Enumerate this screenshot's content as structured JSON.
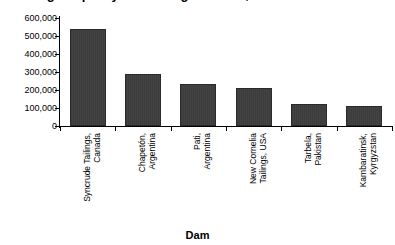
{
  "chart_data": {
    "type": "bar",
    "title": "Storage Capacity of the Largest Dams, in Millions of Gallons",
    "xlabel": "Dam",
    "ylabel": "",
    "categories": [
      "Syncrude Tailings, Canada",
      "Chapetón, Argentina",
      "Pati, Argentina",
      "New Cornelia Tailings, USA",
      "Tarbela, Pakistan",
      "Kambaratinsk, Kyrgyzstan"
    ],
    "category_lines": [
      [
        "Syncrude Tailings,",
        "Canada"
      ],
      [
        "Chapetón,",
        "Argentina"
      ],
      [
        "Pati,",
        "Argentina"
      ],
      [
        "New Cornelia",
        "Tailings, USA"
      ],
      [
        "Tarbela,",
        "Pakistan"
      ],
      [
        "Kambaratinsk,",
        "Kyrgyzstan"
      ]
    ],
    "values": [
      540000,
      290000,
      235000,
      210000,
      122000,
      110000
    ],
    "ylim": [
      0,
      600000
    ],
    "ytick_values": [
      0,
      100000,
      200000,
      300000,
      400000,
      500000,
      600000
    ],
    "ytick_labels": [
      "0",
      "100,000",
      "200,000",
      "300,000",
      "400,000",
      "500,000",
      "600,000"
    ],
    "grid": false,
    "legend": "none",
    "bar_color": "#3d3d3d",
    "bar_edge_color": "#2a2a2a",
    "background_color": "#ffffff",
    "text_color": "#000000"
  }
}
